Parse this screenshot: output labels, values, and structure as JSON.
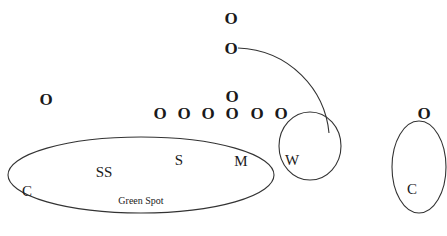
{
  "diagram": {
    "title": "",
    "colors": {
      "line": "#333333",
      "text": "#1a1a1a",
      "background": "#ffffff"
    },
    "offense": [
      {
        "id": "o-top",
        "label": "O",
        "x": 231,
        "y": 24
      },
      {
        "id": "o-motion",
        "label": "O",
        "x": 231,
        "y": 54
      },
      {
        "id": "o-left",
        "label": "O",
        "x": 46,
        "y": 105
      },
      {
        "id": "o-qb",
        "label": "O",
        "x": 232,
        "y": 102
      },
      {
        "id": "o-line-1",
        "label": "O",
        "x": 160,
        "y": 119
      },
      {
        "id": "o-line-2",
        "label": "O",
        "x": 184,
        "y": 119
      },
      {
        "id": "o-line-3",
        "label": "O",
        "x": 208,
        "y": 119
      },
      {
        "id": "o-line-4",
        "label": "O",
        "x": 232,
        "y": 119
      },
      {
        "id": "o-line-5",
        "label": "O",
        "x": 257,
        "y": 119
      },
      {
        "id": "o-line-6",
        "label": "O",
        "x": 281,
        "y": 119
      },
      {
        "id": "o-right",
        "label": "O",
        "x": 424,
        "y": 119
      }
    ],
    "defense": [
      {
        "id": "d-c-left",
        "label": "C",
        "x": 27,
        "y": 196
      },
      {
        "id": "d-ss",
        "label": "SS",
        "x": 104,
        "y": 177
      },
      {
        "id": "d-s",
        "label": "S",
        "x": 179,
        "y": 165
      },
      {
        "id": "d-m",
        "label": "M",
        "x": 241,
        "y": 166
      },
      {
        "id": "d-w",
        "label": "W",
        "x": 292,
        "y": 165
      },
      {
        "id": "d-c-right",
        "label": "C",
        "x": 412,
        "y": 194
      }
    ],
    "zones": [
      {
        "id": "zone-green-spot",
        "label": "Green Spot",
        "cx": 141,
        "cy": 175,
        "rx": 133,
        "ry": 38,
        "label_x": 141,
        "label_y": 204
      },
      {
        "id": "zone-w",
        "label": "",
        "cx": 310,
        "cy": 146,
        "rx": 31,
        "ry": 34
      },
      {
        "id": "zone-right-c",
        "label": "",
        "cx": 419,
        "cy": 167,
        "rx": 27,
        "ry": 46
      }
    ],
    "routes": [
      {
        "id": "route-motion-arc",
        "path": "M 238 48 C 290 50, 325 90, 329 133"
      }
    ],
    "labels": {
      "green_spot": "Green Spot"
    }
  }
}
